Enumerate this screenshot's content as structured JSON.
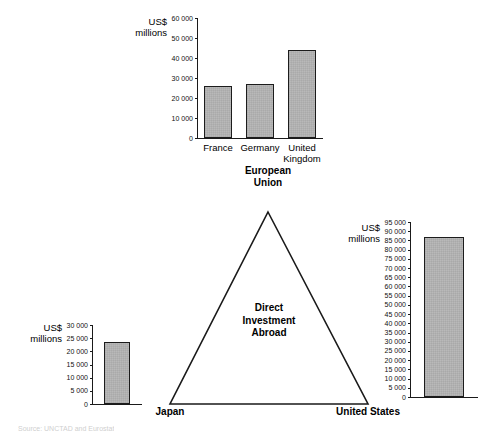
{
  "figure": {
    "center_label": "Direct\nInvestment\nAbroad",
    "source_note": "Source: UNCTAD and Eurostat"
  },
  "nodes": {
    "european_union": "European\nUnion",
    "japan": "Japan",
    "united_states": "United States"
  },
  "chart_data": [
    {
      "id": "eu",
      "type": "bar",
      "title": "",
      "ylabel": "US$\nmillions",
      "xlabel": "",
      "categories": [
        "France",
        "Germany",
        "United\nKingdom"
      ],
      "values": [
        26000,
        27200,
        44000
      ],
      "ylim": [
        0,
        60000
      ],
      "ticks": [
        "0",
        "10 000",
        "20 000",
        "30 000",
        "40 000",
        "50 000",
        "60 000"
      ],
      "tick_values": [
        0,
        10000,
        20000,
        30000,
        40000,
        50000,
        60000
      ],
      "grid": false,
      "legend": "none"
    },
    {
      "id": "japan",
      "type": "bar",
      "title": "",
      "ylabel": "US$\nmillions",
      "xlabel": "",
      "categories": [
        "Japan"
      ],
      "values": [
        23500
      ],
      "ylim": [
        0,
        30000
      ],
      "ticks": [
        "0",
        "5 000",
        "10 000",
        "15 000",
        "20 000",
        "25 000",
        "30 000"
      ],
      "tick_values": [
        0,
        5000,
        10000,
        15000,
        20000,
        25000,
        30000
      ],
      "grid": false,
      "legend": "none"
    },
    {
      "id": "us",
      "type": "bar",
      "title": "",
      "ylabel": "US$\nmillions",
      "xlabel": "",
      "categories": [
        "United States"
      ],
      "values": [
        87000
      ],
      "ylim": [
        0,
        95000
      ],
      "ticks": [
        "0",
        "5 000",
        "10 000",
        "15 000",
        "20 000",
        "25 000",
        "30 000",
        "35 000",
        "40 000",
        "45 000",
        "50 000",
        "55 000",
        "60 000",
        "65 000",
        "70 000",
        "75 000",
        "80 000",
        "85 000",
        "90 000",
        "95 000"
      ],
      "tick_values": [
        0,
        5000,
        10000,
        15000,
        20000,
        25000,
        30000,
        35000,
        40000,
        45000,
        50000,
        55000,
        60000,
        65000,
        70000,
        75000,
        80000,
        85000,
        90000,
        95000
      ],
      "grid": false,
      "legend": "none"
    }
  ]
}
